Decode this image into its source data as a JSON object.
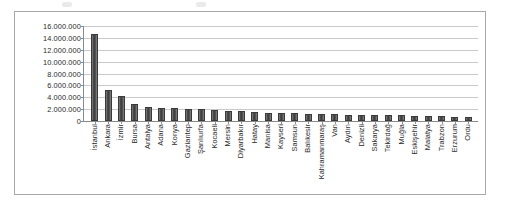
{
  "chart_data": {
    "type": "bar",
    "title": "",
    "xlabel": "",
    "ylabel": "",
    "ylim": [
      0,
      16000000
    ],
    "grid": true,
    "legend": "none",
    "y_ticks": [
      "16.000.000",
      "14.000.000",
      "12.000.000",
      "10.000.000",
      "8.000.000",
      "6.000.000",
      "4.000.000",
      "2.000.000",
      "0"
    ],
    "y_tick_values": [
      16000000,
      14000000,
      12000000,
      10000000,
      8000000,
      6000000,
      4000000,
      2000000,
      0
    ],
    "categories": [
      "İstanbul",
      "Ankara",
      "İzmir",
      "Bursa",
      "Antalya",
      "Adana",
      "Konya",
      "Gaziantep",
      "Şanlıurfa",
      "Kocaeli",
      "Mersin",
      "Diyarbakır",
      "Hatay",
      "Manisa",
      "Kayseri",
      "Samsun",
      "Balıkesir",
      "Kahramanmaraş",
      "Van",
      "Aydın",
      "Denizli",
      "Sakarya",
      "Tekirdağ",
      "Muğla",
      "Eskişehir",
      "Malatya",
      "Trabzon",
      "Erzurum",
      "Ordu"
    ],
    "values": [
      14650000,
      5270000,
      4220000,
      2900000,
      2330000,
      2200000,
      2150000,
      1970000,
      1940000,
      1830000,
      1770000,
      1700000,
      1550000,
      1390000,
      1360000,
      1280000,
      1190000,
      1130000,
      1100000,
      1060000,
      1010000,
      990000,
      960000,
      940000,
      870000,
      790000,
      770000,
      760000,
      750000
    ]
  },
  "colors": {
    "bar_fill": "#4f4f4f",
    "bar_edge": "#3a3a3a",
    "gridline": "#c9c9c9",
    "axis": "#8a8a8a",
    "frame": "#a8a8a8",
    "text": "#2b2b2b",
    "background": "#ffffff"
  }
}
